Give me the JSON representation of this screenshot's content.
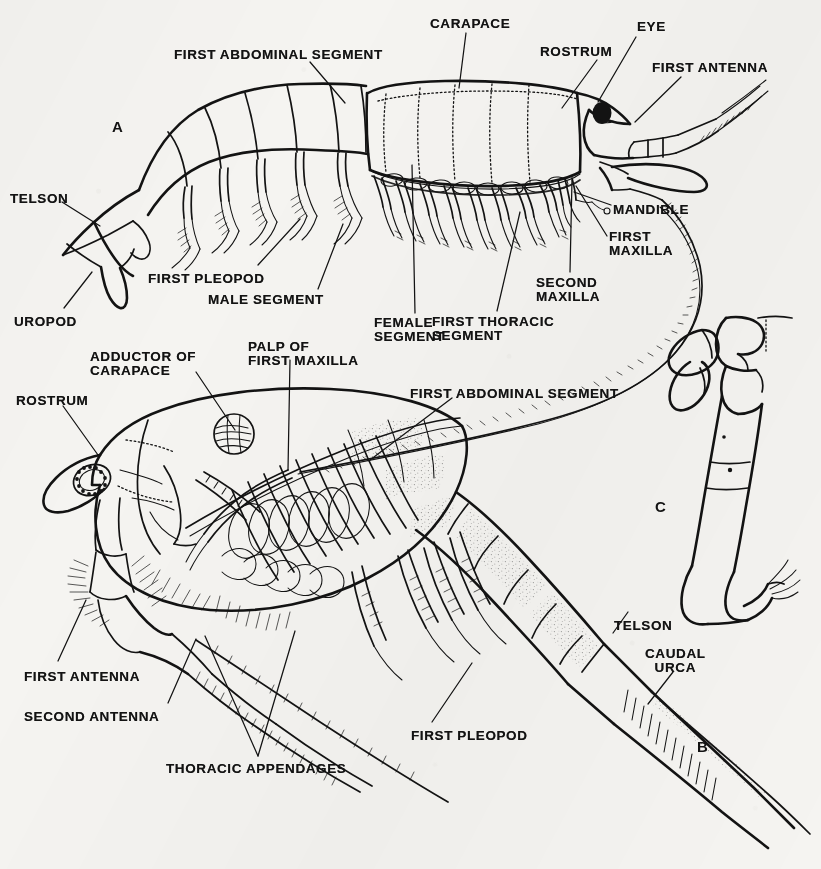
{
  "plate": {
    "title": "Mysid crustacean external anatomy plate",
    "background_color": "#f5f4f1",
    "ink_color": "#131313",
    "width": 821,
    "height": 869
  },
  "figures": [
    {
      "key": "A",
      "label": "A",
      "x": 112,
      "y": 118,
      "caption": "lateral view of whole animal with carapace intact"
    },
    {
      "key": "B",
      "label": "B",
      "x": 697,
      "y": 738,
      "caption": "lateral view with carapace removed showing internal appendages"
    },
    {
      "key": "C",
      "label": "C",
      "x": 655,
      "y": 498,
      "caption": "isolated thoracic appendage"
    }
  ],
  "labels": [
    {
      "id": "a-first-abdominal-segment",
      "text": "FIRST ABDOMINAL SEGMENT",
      "x": 174,
      "y": 48,
      "align": "left",
      "figure": "A"
    },
    {
      "id": "a-carapace",
      "text": "CARAPACE",
      "x": 430,
      "y": 17,
      "align": "left",
      "figure": "A"
    },
    {
      "id": "a-eye",
      "text": "EYE",
      "x": 637,
      "y": 20,
      "align": "left",
      "figure": "A"
    },
    {
      "id": "a-rostrum",
      "text": "ROSTRUM",
      "x": 540,
      "y": 45,
      "align": "left",
      "figure": "A"
    },
    {
      "id": "a-first-antenna",
      "text": "FIRST ANTENNA",
      "x": 652,
      "y": 61,
      "align": "left",
      "figure": "A"
    },
    {
      "id": "a-telson",
      "text": "TELSON",
      "x": 10,
      "y": 192,
      "align": "left",
      "figure": "A"
    },
    {
      "id": "a-uropod",
      "text": "UROPOD",
      "x": 14,
      "y": 315,
      "align": "left",
      "figure": "A"
    },
    {
      "id": "a-first-pleopod",
      "text": "FIRST PLEOPOD",
      "x": 148,
      "y": 272,
      "align": "left",
      "figure": "A"
    },
    {
      "id": "a-male-segment",
      "text": "MALE SEGMENT",
      "x": 208,
      "y": 293,
      "align": "left",
      "figure": "A"
    },
    {
      "id": "a-female-segment",
      "text": "FEMALE\nSEGMENT",
      "x": 374,
      "y": 316,
      "align": "left",
      "figure": "A"
    },
    {
      "id": "a-first-thoracic-segment",
      "text": "FIRST THORACIC\nSEGMENT",
      "x": 432,
      "y": 315,
      "align": "left",
      "figure": "A"
    },
    {
      "id": "a-second-maxilla",
      "text": "SECOND\nMAXILLA",
      "x": 536,
      "y": 276,
      "align": "left",
      "figure": "A"
    },
    {
      "id": "a-first-maxilla",
      "text": "FIRST\nMAXILLA",
      "x": 609,
      "y": 230,
      "align": "left",
      "figure": "A"
    },
    {
      "id": "a-mandible",
      "text": "MANDIBLE",
      "x": 613,
      "y": 203,
      "align": "left",
      "figure": "A"
    },
    {
      "id": "b-adductor-of-carapace",
      "text": "ADDUCTOR OF\nCARAPACE",
      "x": 90,
      "y": 350,
      "align": "left",
      "figure": "B"
    },
    {
      "id": "b-palp-of-first-maxilla",
      "text": "PALP OF\nFIRST MAXILLA",
      "x": 248,
      "y": 340,
      "align": "left",
      "figure": "B"
    },
    {
      "id": "b-rostrum",
      "text": "ROSTRUM",
      "x": 16,
      "y": 394,
      "align": "left",
      "figure": "B"
    },
    {
      "id": "b-first-abdominal-segment",
      "text": "FIRST ABDOMINAL SEGMENT",
      "x": 410,
      "y": 387,
      "align": "left",
      "figure": "B"
    },
    {
      "id": "b-first-antenna",
      "text": "FIRST ANTENNA",
      "x": 24,
      "y": 670,
      "align": "left",
      "figure": "B"
    },
    {
      "id": "b-second-antenna",
      "text": "SECOND ANTENNA",
      "x": 24,
      "y": 710,
      "align": "left",
      "figure": "B"
    },
    {
      "id": "b-thoracic-appendages",
      "text": "THORACIC APPENDAGES",
      "x": 166,
      "y": 762,
      "align": "left",
      "figure": "B"
    },
    {
      "id": "b-first-pleopod",
      "text": "FIRST PLEOPOD",
      "x": 411,
      "y": 729,
      "align": "left",
      "figure": "B"
    },
    {
      "id": "b-telson",
      "text": "TELSON",
      "x": 614,
      "y": 619,
      "align": "left",
      "figure": "B"
    },
    {
      "id": "b-caudal-urca",
      "text": "CAUDAL\nURCA",
      "x": 645,
      "y": 647,
      "align": "left",
      "figure": "B"
    }
  ],
  "anatomy_parts": [
    "carapace",
    "rostrum",
    "eye",
    "first antenna",
    "second antenna",
    "mandible",
    "first maxilla",
    "second maxilla",
    "palp of first maxilla",
    "first thoracic segment",
    "thoracic appendages",
    "first abdominal segment",
    "first pleopod",
    "male segment",
    "female segment",
    "telson",
    "uropod",
    "caudal furca",
    "adductor of carapace"
  ]
}
